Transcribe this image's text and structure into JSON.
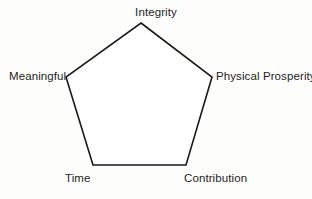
{
  "diagram": {
    "type": "pentagon-node-diagram",
    "shape": "pentagon",
    "stroke_color": "#1a1a1a",
    "fill_color": "#ffffff",
    "background_color": "#fdfdfc",
    "text_color": "#1d1d1d",
    "stroke_width": 1.6,
    "vertices": [
      {
        "id": "integrity",
        "label": "Integrity",
        "x": 141,
        "y": 23,
        "position": "top"
      },
      {
        "id": "physical-prosperity",
        "label": "Physical Prosperity",
        "x": 212,
        "y": 77,
        "position": "right"
      },
      {
        "id": "contribution",
        "label": "Contribution",
        "x": 186,
        "y": 165,
        "position": "bottom-right"
      },
      {
        "id": "time",
        "label": "Time",
        "x": 93,
        "y": 165,
        "position": "bottom-left"
      },
      {
        "id": "meaningful",
        "label": "Meaningful",
        "x": 66,
        "y": 77,
        "position": "left"
      }
    ]
  }
}
